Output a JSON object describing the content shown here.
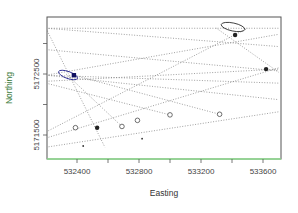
{
  "chart_data": {
    "type": "scatter",
    "title": "",
    "xlabel": "Easting",
    "ylabel": "Northing",
    "xlim": [
      532200,
      533700
    ],
    "ylim": [
      5171300,
      5173300
    ],
    "x_ticks": [
      532400,
      532600,
      532800,
      533000,
      533200,
      533400,
      533600
    ],
    "x_tick_labels": [
      "532400",
      "",
      "532800",
      "",
      "533200",
      "",
      "533600"
    ],
    "y_ticks": [
      5171500,
      5172000,
      5172500,
      5173000
    ],
    "y_tick_labels": [
      "5171500",
      "",
      "5172500",
      ""
    ],
    "grid": false,
    "legend": null,
    "colors": {
      "axis": "#555555",
      "bottom_axis": "#90e090",
      "ylabel": "#3a7a3a",
      "lines": "#777777",
      "ellipse_left": "#1a1a8a",
      "ellipse_right": "#222222",
      "points": "#222222"
    },
    "points": [
      {
        "x": 532380,
        "y": 5172480,
        "style": "filled-square",
        "note": "estimated location with error ellipse"
      },
      {
        "x": 533420,
        "y": 5173140,
        "style": "filled",
        "note": "estimated location with error ellipse"
      },
      {
        "x": 533620,
        "y": 5172580,
        "style": "filled"
      },
      {
        "x": 532390,
        "y": 5171620,
        "style": "open"
      },
      {
        "x": 532530,
        "y": 5171620,
        "style": "filled"
      },
      {
        "x": 532690,
        "y": 5171640,
        "style": "open"
      },
      {
        "x": 532790,
        "y": 5171740,
        "style": "open"
      },
      {
        "x": 533000,
        "y": 5171830,
        "style": "open"
      },
      {
        "x": 533320,
        "y": 5171840,
        "style": "open"
      },
      {
        "x": 532820,
        "y": 5171440,
        "style": "small"
      },
      {
        "x": 532440,
        "y": 5171320,
        "style": "small"
      }
    ],
    "bearing_lines": [
      [
        [
          532200,
          5173250
        ],
        [
          533700,
          5173250
        ]
      ],
      [
        [
          532200,
          5173250
        ],
        [
          533700,
          5172950
        ]
      ],
      [
        [
          532200,
          5173250
        ],
        [
          532580,
          5171300
        ]
      ],
      [
        [
          532200,
          5172480
        ],
        [
          533700,
          5173150
        ]
      ],
      [
        [
          532200,
          5172480
        ],
        [
          533700,
          5172350
        ]
      ],
      [
        [
          532200,
          5172480
        ],
        [
          533700,
          5172080
        ]
      ],
      [
        [
          532200,
          5172380
        ],
        [
          533700,
          5172580
        ]
      ],
      [
        [
          532200,
          5172350
        ],
        [
          533000,
          5171830
        ]
      ],
      [
        [
          532330,
          5172500
        ],
        [
          532690,
          5171640
        ]
      ],
      [
        [
          532200,
          5171550
        ],
        [
          533500,
          5173250
        ]
      ],
      [
        [
          532200,
          5171450
        ],
        [
          533700,
          5172600
        ]
      ],
      [
        [
          532200,
          5171300
        ],
        [
          533700,
          5171880
        ]
      ],
      [
        [
          532380,
          5172480
        ],
        [
          533320,
          5171840
        ]
      ],
      [
        [
          533300,
          5173250
        ],
        [
          533700,
          5172530
        ]
      ],
      [
        [
          532200,
          5172900
        ],
        [
          533700,
          5172550
        ]
      ]
    ]
  }
}
